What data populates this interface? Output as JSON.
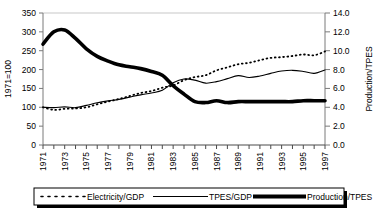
{
  "chart_data": {
    "type": "line",
    "title": "",
    "xlabel": "",
    "ylabel": "1971=100",
    "y2label": "Production/TPES",
    "x": [
      1971,
      1972,
      1973,
      1974,
      1975,
      1976,
      1977,
      1978,
      1979,
      1980,
      1981,
      1982,
      1983,
      1984,
      1985,
      1986,
      1987,
      1988,
      1989,
      1990,
      1991,
      1992,
      1993,
      1994,
      1995,
      1996,
      1997
    ],
    "xtick_labels": [
      "1971",
      "1973",
      "1975",
      "1977",
      "1979",
      "1981",
      "1983",
      "1985",
      "1987",
      "1989",
      "1991",
      "1993",
      "1995",
      "1997"
    ],
    "ylim": [
      0,
      350
    ],
    "yticks": [
      0,
      50,
      100,
      150,
      200,
      250,
      300,
      350
    ],
    "ytick_labels": [
      "0",
      "50",
      "100",
      "150",
      "200",
      "250",
      "300",
      "350"
    ],
    "y2lim": [
      0.0,
      14.0
    ],
    "y2ticks": [
      0.0,
      2.0,
      4.0,
      6.0,
      8.0,
      10.0,
      12.0,
      14.0
    ],
    "y2tick_labels": [
      "0.0",
      "2.0",
      "4.0",
      "6.0",
      "8.0",
      "10.0",
      "12.0",
      "14.0"
    ],
    "grid": false,
    "legend_position": "bottom",
    "series": [
      {
        "name": "Electricity/GDP",
        "axis": "left",
        "style": "dotted",
        "color": "#000000",
        "values": [
          100,
          93,
          96,
          97,
          100,
          108,
          115,
          122,
          130,
          138,
          143,
          152,
          158,
          172,
          180,
          185,
          198,
          206,
          214,
          218,
          225,
          231,
          233,
          236,
          240,
          238,
          248
        ]
      },
      {
        "name": "TPES/GDP",
        "axis": "left",
        "style": "solid-thin",
        "color": "#000000",
        "values": [
          100,
          99,
          101,
          99,
          105,
          112,
          117,
          121,
          127,
          133,
          138,
          145,
          165,
          175,
          172,
          164,
          168,
          176,
          184,
          179,
          183,
          190,
          196,
          198,
          195,
          190,
          199
        ]
      },
      {
        "name": "Production/TPES",
        "axis": "right",
        "style": "solid-thick",
        "color": "#000000",
        "values": [
          10.7,
          12.0,
          12.2,
          11.3,
          10.2,
          9.4,
          8.9,
          8.5,
          8.3,
          8.1,
          7.8,
          7.4,
          6.3,
          5.4,
          4.6,
          4.5,
          4.7,
          4.5,
          4.6,
          4.6,
          4.6,
          4.6,
          4.6,
          4.6,
          4.7,
          4.7,
          4.7
        ]
      }
    ]
  },
  "legend": {
    "items": [
      {
        "label": "Electricity/GDP",
        "marker": "dotted-line"
      },
      {
        "label": "TPES/GDP",
        "marker": "thin-line"
      },
      {
        "label": "Production/TPES",
        "marker": "thick-line"
      }
    ]
  }
}
